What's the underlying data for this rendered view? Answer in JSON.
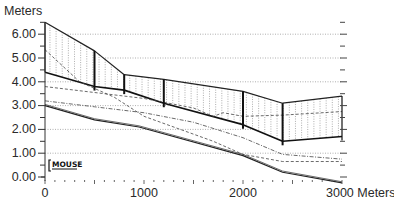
{
  "chart_data": {
    "type": "line",
    "title": "",
    "xlabel": "Meters",
    "ylabel": "Meters",
    "xlim": [
      0,
      3000
    ],
    "ylim": [
      0,
      6.5
    ],
    "x_ticks": [
      0,
      1000,
      2000,
      3000
    ],
    "x_tick_labels": [
      "0",
      "1000",
      "2000",
      "3000 Meters"
    ],
    "y_ticks": [
      0,
      1,
      2,
      3,
      4,
      5,
      6
    ],
    "y_tick_labels": [
      "0.00",
      "1.00",
      "2.00",
      "3.00",
      "4.00",
      "5.00",
      "6.00"
    ],
    "grid": "horizontal dotted at each meter",
    "legend": "none",
    "annotation": "MOUSE",
    "manholes_x": [
      0,
      500,
      800,
      1200,
      2000,
      2400,
      3000
    ],
    "series": [
      {
        "name": "Ground level",
        "style": "solid",
        "x": [
          0,
          500,
          800,
          1200,
          2000,
          2400,
          3000
        ],
        "values": [
          6.5,
          5.3,
          4.3,
          4.1,
          3.6,
          3.1,
          3.4
        ]
      },
      {
        "name": "Pipe crown",
        "style": "solid-thick",
        "x": [
          0,
          500,
          800,
          1200,
          2000,
          2400,
          3000
        ],
        "values": [
          4.4,
          3.8,
          3.65,
          3.1,
          2.2,
          1.5,
          1.7
        ]
      },
      {
        "name": "Pipe invert",
        "style": "solid",
        "x": [
          0,
          500,
          950,
          2000,
          2400,
          3000
        ],
        "values": [
          3.0,
          2.4,
          2.1,
          0.9,
          0.2,
          -0.25
        ]
      },
      {
        "name": "Max water level",
        "style": "dashed",
        "x": [
          0,
          350,
          700,
          1000,
          1700,
          2000,
          2400,
          3000
        ],
        "values": [
          5.35,
          4.0,
          3.35,
          2.55,
          1.5,
          0.95,
          0.65,
          0.65
        ]
      },
      {
        "name": "Water level A",
        "style": "dashed",
        "x": [
          0,
          500,
          1000,
          1500,
          1700,
          1800,
          2000,
          2400,
          3000
        ],
        "values": [
          3.8,
          3.55,
          3.3,
          2.9,
          2.55,
          2.7,
          2.55,
          2.6,
          2.75
        ]
      },
      {
        "name": "Water level B",
        "style": "dash-dot",
        "x": [
          0,
          500,
          1000,
          1500,
          2000,
          2400,
          3000
        ],
        "values": [
          3.2,
          2.95,
          2.7,
          2.3,
          1.65,
          0.95,
          0.75
        ]
      },
      {
        "name": "Invert inner",
        "style": "solid-thin",
        "x": [
          0,
          500,
          950,
          2000,
          2400,
          3000
        ],
        "values": [
          3.05,
          2.45,
          2.15,
          0.95,
          0.25,
          -0.2
        ]
      }
    ]
  },
  "labels": {
    "y_axis_title": "Meters",
    "y_ticks": [
      "6.00",
      "5.00",
      "4.00",
      "3.00",
      "2.00",
      "1.00",
      "0.00"
    ],
    "x_ticks": [
      "0",
      "1000",
      "2000",
      "3000 Meters"
    ],
    "watermark": "MOUSE"
  }
}
